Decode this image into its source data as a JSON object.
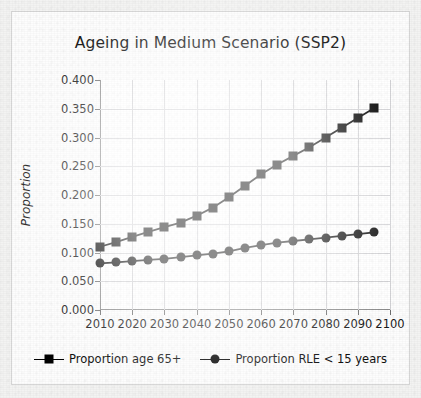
{
  "chart_data": {
    "type": "line",
    "title": "Ageing in Medium Scenario (SSP2)",
    "xlabel": "",
    "ylabel": "Proportion",
    "xlim": [
      2010,
      2100
    ],
    "ylim": [
      0.0,
      0.4
    ],
    "grid": true,
    "legend_position": "bottom",
    "x_ticks": [
      "2010",
      "2020",
      "2030",
      "2040",
      "2050",
      "2060",
      "2070",
      "2080",
      "2090",
      "2100"
    ],
    "y_ticks": [
      "0.000",
      "0.050",
      "0.100",
      "0.150",
      "0.200",
      "0.250",
      "0.300",
      "0.350",
      "0.400"
    ],
    "x": [
      2010,
      2015,
      2020,
      2025,
      2030,
      2035,
      2040,
      2045,
      2050,
      2055,
      2060,
      2065,
      2070,
      2075,
      2080,
      2085,
      2090,
      2095
    ],
    "series": [
      {
        "name": "Proportion age 65+",
        "marker": "square",
        "color": "#000000",
        "values": [
          0.11,
          0.118,
          0.127,
          0.136,
          0.144,
          0.152,
          0.164,
          0.178,
          0.196,
          0.216,
          0.236,
          0.253,
          0.268,
          0.283,
          0.3,
          0.317,
          0.334,
          0.351
        ]
      },
      {
        "name": "Proportion RLE < 15 years",
        "marker": "circle",
        "color": "#000000",
        "values": [
          0.081,
          0.083,
          0.085,
          0.087,
          0.089,
          0.092,
          0.095,
          0.098,
          0.102,
          0.108,
          0.113,
          0.117,
          0.12,
          0.123,
          0.126,
          0.129,
          0.132,
          0.135
        ]
      }
    ]
  },
  "legend": {
    "entries": [
      {
        "label": "Proportion age 65+",
        "marker": "square-marker-icon"
      },
      {
        "label": "Proportion RLE < 15 years",
        "marker": "circle-marker-icon"
      }
    ]
  },
  "colors": {
    "series": "#000000",
    "grid": "#d3d3d6",
    "axis": "#8d8d8d",
    "plot_background": "#ffffff",
    "card_background": "#fdfdfd",
    "page_background": "#f3f3f2"
  }
}
